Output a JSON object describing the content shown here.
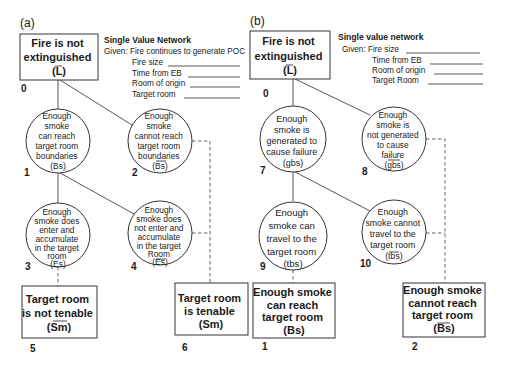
{
  "panels": [
    {
      "label": "(a)",
      "root": {
        "lines": [
          "Fire is not",
          "extinguished",
          "(L)"
        ],
        "number": "0"
      },
      "given": {
        "title": "Single Value Network",
        "lines": [
          "Given: Fire continues to generate POC",
          "Fire size",
          "Time from EB",
          "Room of origin",
          "Target room"
        ]
      },
      "nodes": [
        {
          "id": "1",
          "lines": [
            "Enough",
            "smoke",
            "can reach",
            "target room",
            "boundaries",
            "(Bs)"
          ],
          "negated": false
        },
        {
          "id": "2",
          "lines": [
            "Enough",
            "smoke",
            "cannot reach",
            "target room",
            "boundaries",
            "(Bs)"
          ],
          "negated": true
        },
        {
          "id": "3",
          "lines": [
            "Enough",
            "smoke does",
            "enter and",
            "accumulate",
            "in the target",
            "room",
            "(Es)"
          ],
          "negated": false
        },
        {
          "id": "4",
          "lines": [
            "Enough",
            "smoke does",
            "not enter and",
            "accumulate",
            "in the target",
            "Room",
            "(Es)"
          ],
          "negated": true
        }
      ],
      "outcomes": [
        {
          "id": "5",
          "lines": [
            "Target room",
            "is not tenable",
            "(Sm)"
          ],
          "negated": true
        },
        {
          "id": "6",
          "lines": [
            "Target room",
            "is tenable",
            "(Sm)"
          ],
          "negated": false
        }
      ]
    },
    {
      "label": "(b)",
      "root": {
        "lines": [
          "Fire is not",
          "extinguished",
          "(L)"
        ],
        "number": "0"
      },
      "given": {
        "title": "Single value network",
        "lines": [
          "Given: Fire size",
          "Time from EB",
          "Room of origin",
          "Target Room"
        ]
      },
      "nodes": [
        {
          "id": "7",
          "lines": [
            "Enough",
            "smoke is",
            "generated to",
            "cause failure",
            "(gbs)"
          ],
          "negated": false
        },
        {
          "id": "8",
          "lines": [
            "Enough",
            "smoke is",
            "not generated",
            "to cause",
            "failure",
            "(gbs)"
          ],
          "negated": true
        },
        {
          "id": "9",
          "lines": [
            "Enough",
            "smoke can",
            "travel to the",
            "target room",
            "(tbs)"
          ],
          "negated": false
        },
        {
          "id": "10",
          "lines": [
            "Enough",
            "smoke cannot",
            "travel to the",
            "target room",
            "(tbs)"
          ],
          "negated": true
        }
      ],
      "outcomes": [
        {
          "id": "1",
          "lines": [
            "Enough smoke",
            "can reach",
            "target room",
            "(Bs)"
          ],
          "negated": false
        },
        {
          "id": "2",
          "lines": [
            "Enough smoke",
            "cannot reach",
            "target room",
            "(Bs)"
          ],
          "negated": true
        }
      ]
    }
  ]
}
